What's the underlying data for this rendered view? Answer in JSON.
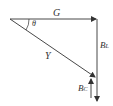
{
  "diagram": {
    "type": "phasor-diagram",
    "labels": {
      "G": "G",
      "theta": "θ",
      "Y": "Y",
      "BL_main": "B",
      "BL_sub": "L",
      "BC_main": "B",
      "BC_sub": "C"
    },
    "vectors": [
      {
        "name": "G",
        "from": [
          10,
          19
        ],
        "to": [
          97,
          19
        ]
      },
      {
        "name": "B_L",
        "from": [
          97,
          19
        ],
        "to": [
          97,
          100
        ]
      },
      {
        "name": "Y",
        "from": [
          10,
          19
        ],
        "to": [
          96,
          78
        ]
      },
      {
        "name": "B_C",
        "from": [
          91,
          97
        ],
        "to": [
          91,
          78
        ]
      }
    ],
    "line_color": "#333333"
  }
}
